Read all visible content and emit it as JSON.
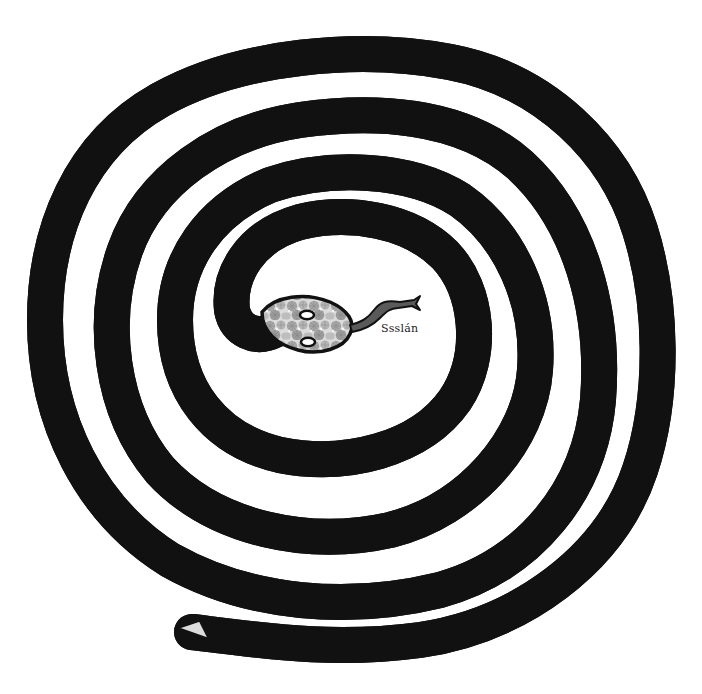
{
  "illustration": {
    "subject": "coiled snake spiral",
    "snake_name_label": "Ssslán",
    "coil_count": 4,
    "colors": {
      "background": "#ffffff",
      "outline": "#111111",
      "body_base": "#d4d4d4",
      "scale_dark": "#9a9a9a",
      "scale_light": "#efefef",
      "tongue": "#555555"
    }
  }
}
